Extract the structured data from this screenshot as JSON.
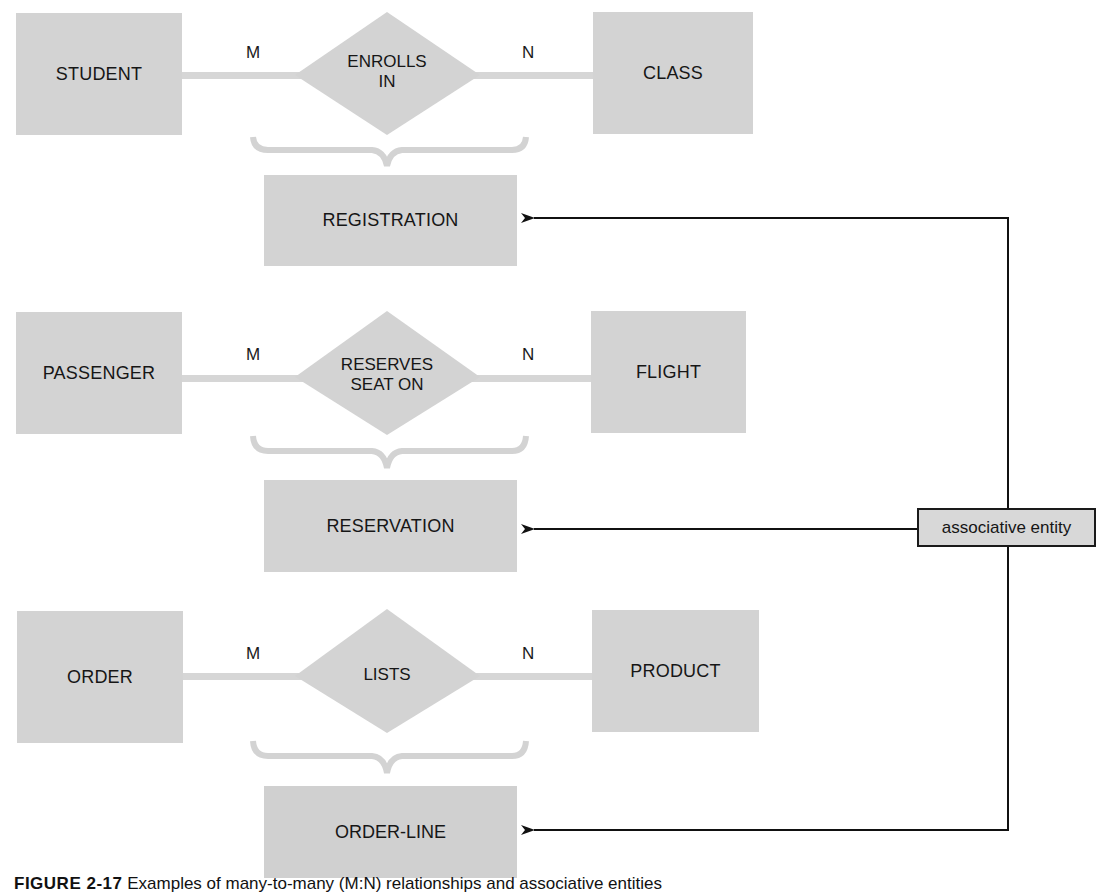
{
  "diagram": {
    "type": "ER diagram",
    "rows": [
      {
        "left_entity": "STUDENT",
        "relationship": [
          "ENROLLS",
          "IN"
        ],
        "right_entity": "CLASS",
        "left_cardinality": "M",
        "right_cardinality": "N",
        "associative_entity": "REGISTRATION"
      },
      {
        "left_entity": "PASSENGER",
        "relationship": [
          "RESERVES",
          "SEAT ON"
        ],
        "right_entity": "FLIGHT",
        "left_cardinality": "M",
        "right_cardinality": "N",
        "associative_entity": "RESERVATION"
      },
      {
        "left_entity": "ORDER",
        "relationship": [
          "LISTS"
        ],
        "right_entity": "PRODUCT",
        "left_cardinality": "M",
        "right_cardinality": "N",
        "associative_entity": "ORDER-LINE"
      }
    ],
    "callout_label": "associative entity",
    "colors": {
      "entity_fill": "#d3d3d3",
      "connector": "#d6d6d6",
      "arrow": "#111111"
    }
  },
  "caption": {
    "figure_number": "FIGURE 2-17",
    "text": "Examples of many-to-many (M:N) relationships and associative entities"
  }
}
